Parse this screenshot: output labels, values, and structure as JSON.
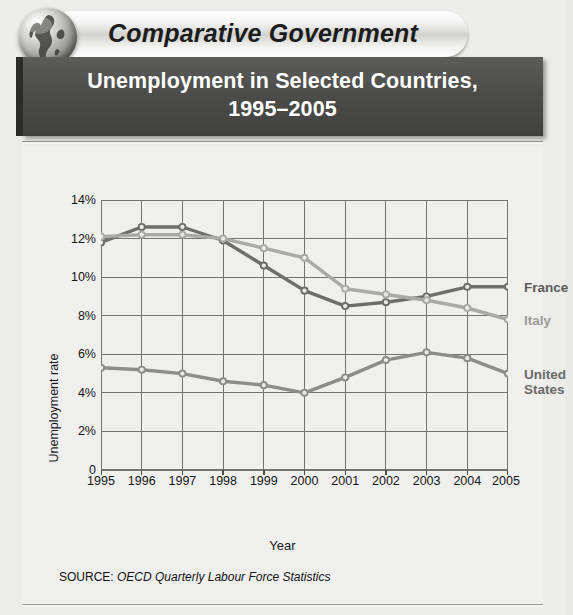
{
  "banner": {
    "label": "Comparative Government",
    "icon": "globe-icon"
  },
  "title": {
    "line1": "Unemployment in Selected Countries,",
    "line2": "1995–2005"
  },
  "source": {
    "prefix": "SOURCE:",
    "citation": "OECD Quarterly Labour Force Statistics"
  },
  "axis": {
    "y_title": "Unemployment rate",
    "x_title": "Year",
    "y_ticks": [
      "14%",
      "12%",
      "10%",
      "8%",
      "6%",
      "4%",
      "2%",
      "0"
    ],
    "x_ticks": [
      "1995",
      "1996",
      "1997",
      "1998",
      "1999",
      "2000",
      "2001",
      "2002",
      "2003",
      "2004",
      "2005"
    ]
  },
  "legend": {
    "france": "France",
    "italy": "Italy",
    "united": "United",
    "states": "States"
  },
  "colors": {
    "france": "#6d6d6b",
    "italy": "#a9a9a6",
    "united_states": "#8c8c8a",
    "grid": "#74746f",
    "axis": "#4a4a47",
    "figure_bg": "#efefee",
    "titlebar_bg": "#4c4c4a",
    "title_text": "#ffffff"
  },
  "chart_data": {
    "type": "line",
    "title": "Unemployment in Selected Countries, 1995–2005",
    "xlabel": "Year",
    "ylabel": "Unemployment rate",
    "x": [
      1995,
      1996,
      1997,
      1998,
      1999,
      2000,
      2001,
      2002,
      2003,
      2004,
      2005
    ],
    "categories": [
      "1995",
      "1996",
      "1997",
      "1998",
      "1999",
      "2000",
      "2001",
      "2002",
      "2003",
      "2004",
      "2005"
    ],
    "ylim": [
      0,
      14
    ],
    "xlim": [
      1995,
      2005
    ],
    "y_tick_values": [
      0,
      2,
      4,
      6,
      8,
      10,
      12,
      14
    ],
    "y_unit": "percent",
    "grid": true,
    "legend_position": "right",
    "series": [
      {
        "name": "France",
        "color": "#6d6d6b",
        "values": [
          11.8,
          12.6,
          12.6,
          11.9,
          10.6,
          9.3,
          8.5,
          8.7,
          9.0,
          9.5,
          9.5
        ]
      },
      {
        "name": "Italy",
        "color": "#a9a9a6",
        "values": [
          12.1,
          12.2,
          12.2,
          12.0,
          11.5,
          11.0,
          9.4,
          9.1,
          8.8,
          8.4,
          7.8
        ]
      },
      {
        "name": "United States",
        "color": "#8c8c8a",
        "values": [
          5.3,
          5.2,
          5.0,
          4.6,
          4.4,
          4.0,
          4.8,
          5.7,
          6.1,
          5.8,
          5.0
        ]
      }
    ],
    "source": "SOURCE: OECD Quarterly Labour Force Statistics"
  }
}
